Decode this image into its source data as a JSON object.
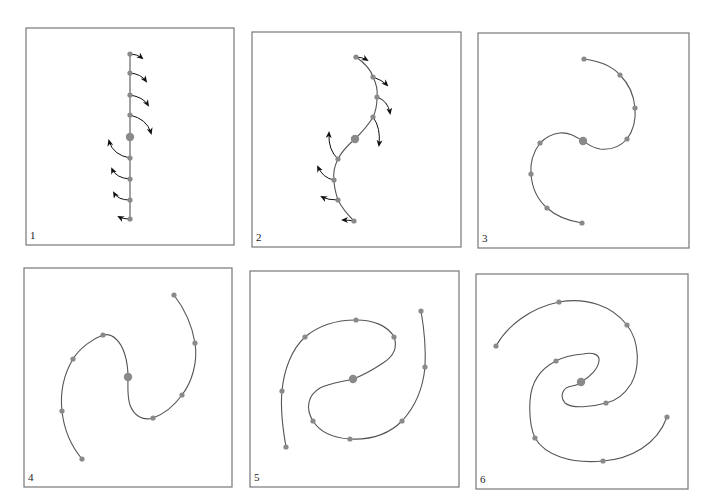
{
  "figure": {
    "colors": {
      "frame": "#777777",
      "curve": "#555555",
      "point": "#8a8a8a",
      "arrow": "#111111"
    },
    "panels": [
      {
        "label": "1",
        "frame": [
          26,
          28,
          208,
          217
        ],
        "curve": "M130,54 L130,219",
        "center": [
          130,
          137
        ],
        "points": [
          [
            130,
            54
          ],
          [
            130,
            73
          ],
          [
            130,
            95
          ],
          [
            130,
            115
          ],
          [
            130,
            158
          ],
          [
            130,
            179
          ],
          [
            130,
            200
          ],
          [
            130,
            219
          ]
        ],
        "arrows": [
          {
            "d": "M130,54 Q137,54 142,58",
            "tip": [
              142,
              58
            ],
            "dir": [
              1,
              0.6
            ]
          },
          {
            "d": "M130,73 Q141,74 146,81",
            "tip": [
              146,
              81
            ],
            "dir": [
              0.7,
              0.8
            ]
          },
          {
            "d": "M130,95 Q143,97 148,105",
            "tip": [
              148,
              105
            ],
            "dir": [
              0.5,
              0.9
            ]
          },
          {
            "d": "M130,115 Q147,119 151,133",
            "tip": [
              151,
              133
            ],
            "dir": [
              0.2,
              1
            ]
          },
          {
            "d": "M130,158 Q113,155 109,141",
            "tip": [
              109,
              141
            ],
            "dir": [
              -0.2,
              -1
            ]
          },
          {
            "d": "M130,179 Q116,178 112,169",
            "tip": [
              112,
              169
            ],
            "dir": [
              -0.5,
              -0.9
            ]
          },
          {
            "d": "M130,200 Q118,200 114,193",
            "tip": [
              114,
              193
            ],
            "dir": [
              -0.7,
              -0.8
            ]
          },
          {
            "d": "M130,219 Q123,219 119,217",
            "tip": [
              119,
              217
            ],
            "dir": [
              -1,
              -0.4
            ]
          }
        ]
      },
      {
        "label": "2",
        "frame": [
          252,
          32,
          209,
          215
        ],
        "curve": "M356,57 C366,64 371,70 373,77 C377,85 378,90 377,97 C377,105 376,111 373,117 C368,126 362,132 355,139 C348,145 342,151 338,159 C334,167 333,173 334,180 C334,188 336,194 338,200 C342,208 348,215 354,221",
        "center": [
          355,
          139
        ],
        "points": [
          [
            356,
            57
          ],
          [
            373,
            77
          ],
          [
            377,
            97
          ],
          [
            373,
            117
          ],
          [
            338,
            159
          ],
          [
            334,
            180
          ],
          [
            338,
            200
          ],
          [
            354,
            221
          ]
        ],
        "arrows": [
          {
            "d": "M356,57 Q362,57 367,60",
            "tip": [
              367,
              60
            ],
            "dir": [
              1,
              0.4
            ]
          },
          {
            "d": "M373,77 Q382,80 387,85",
            "tip": [
              387,
              85
            ],
            "dir": [
              0.8,
              0.6
            ]
          },
          {
            "d": "M377,97 Q388,101 390,113",
            "tip": [
              390,
              113
            ],
            "dir": [
              0.3,
              1
            ]
          },
          {
            "d": "M373,117 Q381,128 379,145",
            "tip": [
              379,
              145
            ],
            "dir": [
              -0.1,
              1
            ]
          },
          {
            "d": "M338,159 Q328,150 329,133",
            "tip": [
              329,
              133
            ],
            "dir": [
              0.05,
              -1
            ]
          },
          {
            "d": "M334,180 Q323,178 318,167",
            "tip": [
              318,
              167
            ],
            "dir": [
              -0.5,
              -0.9
            ]
          },
          {
            "d": "M338,200 Q328,200 322,197",
            "tip": [
              322,
              197
            ],
            "dir": [
              -1,
              -0.4
            ]
          },
          {
            "d": "M354,221 Q348,220 343,220",
            "tip": [
              343,
              220
            ],
            "dir": [
              -1,
              0
            ]
          }
        ]
      },
      {
        "label": "3",
        "frame": [
          478,
          33,
          211,
          215
        ],
        "curve": "M584,59 C600,61 612,66 620,75 C630,85 634,96 635,108 C636,120 633,131 627,139 C620,147 610,150 600,149 C592,148 588,144 583,141 C575,136 568,132 560,133 C551,134 545,138 540,143 C534,151 530,162 531,174 C532,188 538,200 547,208 C557,217 569,221 582,223",
        "center": [
          583,
          141
        ],
        "points": [
          [
            584,
            59
          ],
          [
            620,
            75
          ],
          [
            635,
            108
          ],
          [
            627,
            139
          ],
          [
            540,
            143
          ],
          [
            531,
            174
          ],
          [
            547,
            208
          ],
          [
            582,
            223
          ]
        ],
        "arrows": []
      },
      {
        "label": "4",
        "frame": [
          24,
          268,
          208,
          219
        ],
        "curve": "M174,295 C184,308 192,325 195,343 C198,362 192,382 182,395 C174,406 164,414 153,418 C143,421 134,416 130,405 C127,396 128,386 128,377 C128,362 124,346 116,339 C112,335 107,334 103,335 C92,339 80,348 73,359 C64,374 60,393 62,411 C64,430 72,447 82,459",
        "center": [
          128,
          377
        ],
        "points": [
          [
            174,
            295
          ],
          [
            195,
            343
          ],
          [
            182,
            395
          ],
          [
            153,
            418
          ],
          [
            103,
            335
          ],
          [
            73,
            359
          ],
          [
            62,
            411
          ],
          [
            82,
            459
          ]
        ],
        "arrows": []
      },
      {
        "label": "5",
        "frame": [
          250,
          271,
          209,
          216
        ],
        "curve": "M421,311 C424,328 426,348 425,367 C423,388 415,407 402,421 C389,434 370,440 350,439 C333,438 320,432 313,421 C305,408 308,395 320,388 C330,383 342,382 353,379 C364,375 374,369 383,363 C394,356 398,348 394,337 C388,326 374,320 356,320 C336,320 318,326 305,337 C292,349 284,369 282,391 C280,411 283,430 286,447",
        "center": [
          353,
          379
        ],
        "points": [
          [
            421,
            311
          ],
          [
            425,
            367
          ],
          [
            402,
            421
          ],
          [
            350,
            439
          ],
          [
            313,
            421
          ],
          [
            394,
            337
          ],
          [
            356,
            320
          ],
          [
            305,
            337
          ],
          [
            282,
            391
          ],
          [
            286,
            447
          ]
        ],
        "arrows": []
      },
      {
        "label": "6",
        "frame": [
          476,
          274,
          212,
          215
        ],
        "curve": "M496,346 C507,326 530,308 559,302 C587,297 612,306 627,325 C640,342 640,368 631,384 C624,395 616,401 606,403 C592,407 572,409 565,403 C559,396 563,387 572,386 C577,385 580,384 581,382 C590,377 598,369 599,361 C600,354 592,352 583,354 C572,355 563,357 556,361 C540,369 531,383 530,401 C529,418 531,429 535,438 C545,455 570,464 603,461 C630,459 657,445 667,417",
        "center": [
          581,
          382
        ],
        "points": [
          [
            496,
            346
          ],
          [
            559,
            302
          ],
          [
            627,
            325
          ],
          [
            606,
            403
          ],
          [
            556,
            361
          ],
          [
            535,
            438
          ],
          [
            603,
            461
          ],
          [
            667,
            417
          ]
        ],
        "arrows": []
      }
    ]
  }
}
